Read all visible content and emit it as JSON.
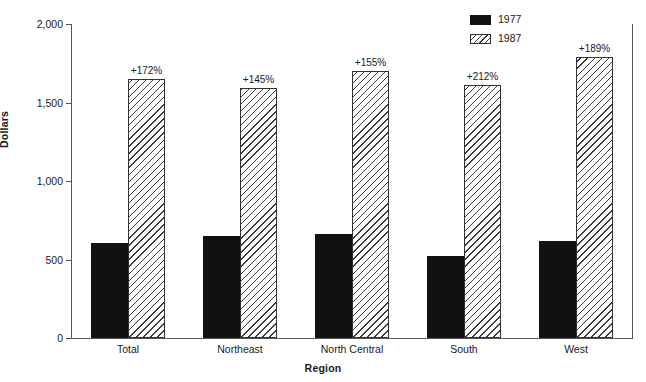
{
  "chart_data": {
    "type": "bar",
    "title": "",
    "subtitle": "",
    "xlabel": "Region",
    "ylabel": "Dollars",
    "categories": [
      "Total",
      "Northeast",
      "North Central",
      "South",
      "West"
    ],
    "series": [
      {
        "name": "1977",
        "values": [
          605,
          650,
          660,
          520,
          615
        ]
      },
      {
        "name": "1987",
        "values": [
          1650,
          1595,
          1700,
          1610,
          1790
        ]
      }
    ],
    "annotations": [
      "+172%",
      "+145%",
      "+155%",
      "+212%",
      "+189%"
    ],
    "ylim": [
      0,
      2000
    ],
    "yticks": [
      0,
      500,
      1000,
      1500,
      2000
    ],
    "ytick_labels": [
      "0",
      "500",
      "1,000",
      "1,500",
      "2,000"
    ],
    "grid": false,
    "legend_position": "top-right",
    "colors": {
      "series_1977": "#111111",
      "series_1987_fill": "#ffffff",
      "series_1987_hatch": "#3a3a3a",
      "axis": "#555555",
      "text": "#1a1a1a",
      "background": "#ffffff"
    }
  },
  "legend": {
    "items": [
      {
        "label": "1977",
        "swatch": "solid-black-swatch"
      },
      {
        "label": "1987",
        "swatch": "hatched-swatch"
      }
    ]
  },
  "axes": {
    "y_title": "Dollars",
    "x_title": "Region",
    "y_tick_labels": [
      "2,000",
      "1,500",
      "1,000",
      "500",
      "0"
    ]
  }
}
